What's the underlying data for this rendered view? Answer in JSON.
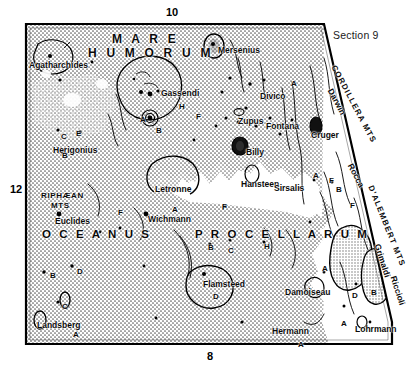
{
  "page": {
    "section_label": "Section 9",
    "background_color": "#ffffff",
    "ink_color": "#111111",
    "mare_fill_color": "#c9c9c9",
    "highland_fill_color": "#ffffff"
  },
  "coordinates": {
    "top": "10",
    "left": "12",
    "bottom": "8"
  },
  "mare_names": [
    {
      "id": "mare-humorum-line1",
      "text": "M A R E",
      "x": 112,
      "y": 33
    },
    {
      "id": "mare-humorum-line2",
      "text": "H U M O R U M",
      "x": 88,
      "y": 47
    },
    {
      "id": "oceanus",
      "text": "O C E A N U S",
      "x": 42,
      "y": 229
    },
    {
      "id": "procellarum",
      "text": "P R O C E L L A R U M",
      "x": 195,
      "y": 229
    }
  ],
  "mountain_ranges": [
    {
      "id": "cordillera-mts",
      "text": "CORDILLERA MTS",
      "x": 333,
      "y": 62,
      "rotate": 62
    },
    {
      "id": "dalembert-mts",
      "text": "D'ALEMBERT MTS",
      "x": 370,
      "y": 182,
      "rotate": 68
    },
    {
      "id": "riphaean-mts-1",
      "text": "RIPHÆAN",
      "x": 41,
      "y": 192
    },
    {
      "id": "riphaean-mts-2",
      "text": "MTS",
      "x": 51,
      "y": 202
    }
  ],
  "craters": [
    {
      "id": "agatharchides",
      "text": "Agatharchides",
      "x": 29,
      "y": 61
    },
    {
      "id": "mersenius",
      "text": "Mersenius",
      "x": 218,
      "y": 46
    },
    {
      "id": "gassendi",
      "text": "Gassendi",
      "x": 161,
      "y": 89
    },
    {
      "id": "divico",
      "text": "Divico",
      "x": 260,
      "y": 92
    },
    {
      "id": "zupus",
      "text": "Zupus",
      "x": 238,
      "y": 117
    },
    {
      "id": "fontana",
      "text": "Fontana",
      "x": 266,
      "y": 122
    },
    {
      "id": "cruger",
      "text": "Cruger",
      "x": 311,
      "y": 131
    },
    {
      "id": "herigonius",
      "text": "Herigonius",
      "x": 53,
      "y": 146
    },
    {
      "id": "billy",
      "text": "Billy",
      "x": 246,
      "y": 148
    },
    {
      "id": "letronne",
      "text": "Letronne",
      "x": 155,
      "y": 185
    },
    {
      "id": "hansteen",
      "text": "Hansteen",
      "x": 241,
      "y": 180
    },
    {
      "id": "sirsalis",
      "text": "Sirsalis",
      "x": 274,
      "y": 184
    },
    {
      "id": "euclides",
      "text": "Euclides",
      "x": 55,
      "y": 217
    },
    {
      "id": "wichmann",
      "text": "Wichmann",
      "x": 148,
      "y": 215
    },
    {
      "id": "flamsteed",
      "text": "Flamsteed",
      "x": 203,
      "y": 280
    },
    {
      "id": "damoiseau",
      "text": "Damoiseau",
      "x": 285,
      "y": 288
    },
    {
      "id": "hermann",
      "text": "Hermann",
      "x": 272,
      "y": 327
    },
    {
      "id": "landsberg",
      "text": "Landsberg",
      "x": 37,
      "y": 321
    },
    {
      "id": "darwin",
      "text": "Darwin",
      "x": 330,
      "y": 85,
      "rotate": 62
    },
    {
      "id": "rocca",
      "text": "Rocca",
      "x": 350,
      "y": 160,
      "rotate": 62
    },
    {
      "id": "grimaldi",
      "text": "Grimaldi",
      "x": 377,
      "y": 240,
      "rotate": 72
    },
    {
      "id": "riccioli",
      "text": "Riccioli",
      "x": 393,
      "y": 272,
      "rotate": 72
    },
    {
      "id": "lohrmann",
      "text": "Lohrmann",
      "x": 355,
      "y": 325
    }
  ],
  "satellite_letters": [
    {
      "id": "sat-gassendi-a",
      "text": "A",
      "x": 140,
      "y": 116
    },
    {
      "id": "sat-gassendi-b",
      "text": "B",
      "x": 156,
      "y": 127
    },
    {
      "id": "sat-gassendi-h",
      "text": "H",
      "x": 179,
      "y": 103
    },
    {
      "id": "sat-gassendi-f",
      "text": "F",
      "x": 196,
      "y": 113
    },
    {
      "id": "sat-herigonius-c",
      "text": "C",
      "x": 61,
      "y": 133
    },
    {
      "id": "sat-herigonius-e",
      "text": "E",
      "x": 76,
      "y": 130
    },
    {
      "id": "sat-herigonius-b",
      "text": "B",
      "x": 62,
      "y": 152
    },
    {
      "id": "sat-divico-a",
      "text": "A",
      "x": 291,
      "y": 80
    },
    {
      "id": "sat-oceanus-f",
      "text": "F",
      "x": 118,
      "y": 209
    },
    {
      "id": "sat-wichmann-a",
      "text": "A",
      "x": 172,
      "y": 206
    },
    {
      "id": "sat-procellarum-f",
      "text": "F",
      "x": 222,
      "y": 204
    },
    {
      "id": "sat-proc-b",
      "text": "B",
      "x": 208,
      "y": 244
    },
    {
      "id": "sat-proc-c",
      "text": "C",
      "x": 228,
      "y": 247
    },
    {
      "id": "sat-proc-h",
      "text": "H",
      "x": 264,
      "y": 243
    },
    {
      "id": "sat-flamsteed-d",
      "text": "D",
      "x": 213,
      "y": 293
    },
    {
      "id": "sat-landsberg-b",
      "text": "B",
      "x": 50,
      "y": 272
    },
    {
      "id": "sat-landsberg-d",
      "text": "D",
      "x": 77,
      "y": 268
    },
    {
      "id": "sat-landsberg-c",
      "text": "C",
      "x": 62,
      "y": 303
    },
    {
      "id": "sat-landsberg-a",
      "text": "A",
      "x": 73,
      "y": 331
    },
    {
      "id": "sat-sirsalis-a",
      "text": "A",
      "x": 313,
      "y": 172
    },
    {
      "id": "sat-sirsalis-f",
      "text": "F",
      "x": 329,
      "y": 177
    },
    {
      "id": "sat-sirsalis-b",
      "text": "B",
      "x": 336,
      "y": 186
    },
    {
      "id": "sat-hansteen-f",
      "text": "F",
      "x": 222,
      "y": 203
    },
    {
      "id": "sat-dalembert-f",
      "text": "F",
      "x": 350,
      "y": 202
    },
    {
      "id": "sat-grimaldi-a",
      "text": "A",
      "x": 322,
      "y": 265
    },
    {
      "id": "sat-grimaldi-d",
      "text": "D",
      "x": 352,
      "y": 292
    },
    {
      "id": "sat-grimaldi-b",
      "text": "B",
      "x": 371,
      "y": 289
    },
    {
      "id": "sat-lohrmann-a",
      "text": "A",
      "x": 341,
      "y": 320
    },
    {
      "id": "sat-hermann-a",
      "text": "A",
      "x": 298,
      "y": 341
    }
  ]
}
